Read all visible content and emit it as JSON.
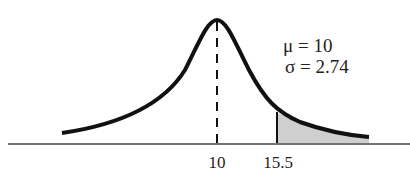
{
  "diagram": {
    "type": "normal-distribution-curve",
    "parameters": [
      {
        "symbol": "μ",
        "equals": "=",
        "value": "10",
        "text": "μ = 10"
      },
      {
        "symbol": "σ",
        "equals": "=",
        "value": "2.74",
        "text": "σ = 2.74"
      }
    ],
    "axis_ticks": [
      {
        "label": "10",
        "x_value": 10
      },
      {
        "label": "15.5",
        "x_value": 15.5
      }
    ],
    "mean_line": {
      "style": "dashed",
      "at": "10"
    },
    "shaded_region": {
      "from": "15.5",
      "to": "right tail",
      "color": "#c8c8c8"
    },
    "colors": {
      "curve": "#111111",
      "axis": "#444444",
      "shade": "#cfcfcf",
      "text": "#222222"
    }
  }
}
